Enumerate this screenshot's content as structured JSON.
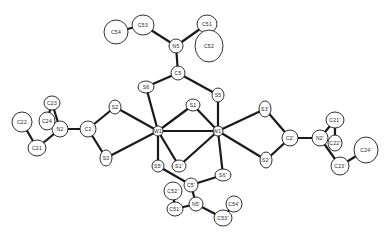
{
  "diagram": {
    "type": "ORTEP molecular structure",
    "atoms": [
      {
        "id": "W1",
        "label": "W1",
        "x": 158,
        "y": 131,
        "rx": 5,
        "ry": 5
      },
      {
        "id": "W1p",
        "label": "W1'",
        "x": 218,
        "y": 131,
        "rx": 5,
        "ry": 5
      },
      {
        "id": "S1",
        "label": "S1",
        "x": 193,
        "y": 105,
        "rx": 7,
        "ry": 6
      },
      {
        "id": "S1p",
        "label": "S1'",
        "x": 179,
        "y": 166,
        "rx": 7,
        "ry": 6
      },
      {
        "id": "S5",
        "label": "S5",
        "x": 218,
        "y": 95,
        "rx": 6,
        "ry": 7
      },
      {
        "id": "S5p",
        "label": "S5'",
        "x": 158,
        "y": 166,
        "rx": 6,
        "ry": 6
      },
      {
        "id": "S6",
        "label": "S6",
        "x": 146,
        "y": 87,
        "rx": 8,
        "ry": 6
      },
      {
        "id": "S6p",
        "label": "S6'",
        "x": 223,
        "y": 175,
        "rx": 8,
        "ry": 6
      },
      {
        "id": "C5",
        "label": "C5",
        "x": 178,
        "y": 73,
        "rx": 7,
        "ry": 7
      },
      {
        "id": "N5",
        "label": "N5",
        "x": 176,
        "y": 46,
        "rx": 7,
        "ry": 7
      },
      {
        "id": "C51",
        "label": "C51",
        "x": 207,
        "y": 24,
        "rx": 10,
        "ry": 9
      },
      {
        "id": "C52",
        "label": "C52",
        "x": 209,
        "y": 46,
        "rx": 14,
        "ry": 16
      },
      {
        "id": "C53",
        "label": "C53",
        "x": 143,
        "y": 25,
        "rx": 11,
        "ry": 10
      },
      {
        "id": "C54",
        "label": "C54",
        "x": 116,
        "y": 32,
        "rx": 12,
        "ry": 12
      },
      {
        "id": "C5p",
        "label": "C5'",
        "x": 191,
        "y": 185,
        "rx": 7,
        "ry": 7
      },
      {
        "id": "N5p",
        "label": "N5'",
        "x": 196,
        "y": 204,
        "rx": 7,
        "ry": 7
      },
      {
        "id": "C51p",
        "label": "C51'",
        "x": 175,
        "y": 209,
        "rx": 8,
        "ry": 7
      },
      {
        "id": "C52p",
        "label": "C52'",
        "x": 173,
        "y": 191,
        "rx": 9,
        "ry": 9
      },
      {
        "id": "C53p",
        "label": "C53'",
        "x": 223,
        "y": 218,
        "rx": 9,
        "ry": 8
      },
      {
        "id": "C54p",
        "label": "C54'",
        "x": 234,
        "y": 204,
        "rx": 8,
        "ry": 8
      },
      {
        "id": "S2",
        "label": "S2",
        "x": 115,
        "y": 107,
        "rx": 6,
        "ry": 7
      },
      {
        "id": "S3",
        "label": "S3",
        "x": 106,
        "y": 158,
        "rx": 6,
        "ry": 8
      },
      {
        "id": "C2",
        "label": "C2",
        "x": 88,
        "y": 129,
        "rx": 8,
        "ry": 8
      },
      {
        "id": "N2",
        "label": "N2",
        "x": 60,
        "y": 129,
        "rx": 8,
        "ry": 8
      },
      {
        "id": "C23",
        "label": "C23",
        "x": 52,
        "y": 103,
        "rx": 8,
        "ry": 7
      },
      {
        "id": "C24",
        "label": "C24",
        "x": 47,
        "y": 121,
        "rx": 8,
        "ry": 9
      },
      {
        "id": "C22",
        "label": "C22",
        "x": 22,
        "y": 122,
        "rx": 10,
        "ry": 10
      },
      {
        "id": "C21",
        "label": "C21",
        "x": 37,
        "y": 148,
        "rx": 9,
        "ry": 8
      },
      {
        "id": "S3p",
        "label": "S3'",
        "x": 265,
        "y": 109,
        "rx": 6,
        "ry": 8
      },
      {
        "id": "S2p",
        "label": "S2'",
        "x": 266,
        "y": 160,
        "rx": 6,
        "ry": 8
      },
      {
        "id": "C2p",
        "label": "C2'",
        "x": 290,
        "y": 138,
        "rx": 8,
        "ry": 8
      },
      {
        "id": "N2p",
        "label": "N2'",
        "x": 320,
        "y": 138,
        "rx": 8,
        "ry": 8
      },
      {
        "id": "C21p",
        "label": "C21'",
        "x": 335,
        "y": 120,
        "rx": 9,
        "ry": 8
      },
      {
        "id": "C22p",
        "label": "C22'",
        "x": 335,
        "y": 143,
        "rx": 7,
        "ry": 8
      },
      {
        "id": "C23p",
        "label": "C23'",
        "x": 340,
        "y": 166,
        "rx": 9,
        "ry": 9
      },
      {
        "id": "C24p",
        "label": "C24'",
        "x": 366,
        "y": 150,
        "rx": 12,
        "ry": 13
      }
    ],
    "bonds": [
      [
        "W1",
        "W1p"
      ],
      [
        "W1",
        "S1"
      ],
      [
        "W1p",
        "S1"
      ],
      [
        "W1",
        "S1p"
      ],
      [
        "W1p",
        "S1p"
      ],
      [
        "W1",
        "S6"
      ],
      [
        "W1p",
        "S5"
      ],
      [
        "W1",
        "S5p"
      ],
      [
        "W1p",
        "S6p"
      ],
      [
        "S6",
        "C5"
      ],
      [
        "S5",
        "C5"
      ],
      [
        "C5",
        "N5"
      ],
      [
        "N5",
        "C53"
      ],
      [
        "C53",
        "C54"
      ],
      [
        "N5",
        "C51"
      ],
      [
        "C51",
        "C52"
      ],
      [
        "S5p",
        "C5p"
      ],
      [
        "S6p",
        "C5p"
      ],
      [
        "C5p",
        "N5p"
      ],
      [
        "N5p",
        "C51p"
      ],
      [
        "C51p",
        "C52p"
      ],
      [
        "N5p",
        "C53p"
      ],
      [
        "C53p",
        "C54p"
      ],
      [
        "W1",
        "S2"
      ],
      [
        "W1",
        "S3"
      ],
      [
        "S2",
        "C2"
      ],
      [
        "S3",
        "C2"
      ],
      [
        "C2",
        "N2"
      ],
      [
        "N2",
        "C23"
      ],
      [
        "C23",
        "C24"
      ],
      [
        "N2",
        "C21"
      ],
      [
        "C21",
        "C22"
      ],
      [
        "W1p",
        "S3p"
      ],
      [
        "W1p",
        "S2p"
      ],
      [
        "S3p",
        "C2p"
      ],
      [
        "S2p",
        "C2p"
      ],
      [
        "C2p",
        "N2p"
      ],
      [
        "N2p",
        "C21p"
      ],
      [
        "C21p",
        "C22p"
      ],
      [
        "N2p",
        "C23p"
      ],
      [
        "C23p",
        "C24p"
      ]
    ]
  }
}
